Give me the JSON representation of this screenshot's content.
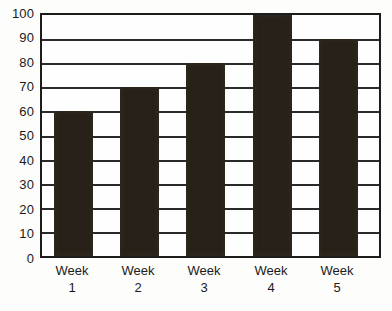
{
  "chart_data": {
    "type": "bar",
    "title": "",
    "subtitle": "",
    "xlabel": "",
    "ylabel": "",
    "categories": [
      "Week 1",
      "Week 2",
      "Week 3",
      "Week 4",
      "Week 5"
    ],
    "category_lines": [
      {
        "name": "Week",
        "num": "1"
      },
      {
        "name": "Week",
        "num": "2"
      },
      {
        "name": "Week",
        "num": "3"
      },
      {
        "name": "Week",
        "num": "4"
      },
      {
        "name": "Week",
        "num": "5"
      }
    ],
    "values": [
      60,
      70,
      80,
      100,
      90
    ],
    "ylim": [
      0,
      100
    ],
    "ytick_step": 10,
    "yticks": [
      100,
      90,
      80,
      70,
      60,
      50,
      40,
      30,
      20,
      10,
      0
    ],
    "grid": "horizontal",
    "legend": "none",
    "bar_color": "#272119",
    "axis_color": "#1c1c1c",
    "background_color": "#fdfdfb",
    "annotations": []
  }
}
